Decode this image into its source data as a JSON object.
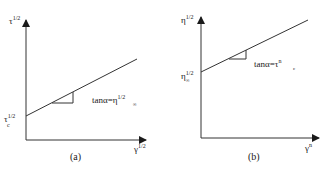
{
  "panels": [
    {
      "id": "a",
      "caption": "(a)",
      "y_axis_label": {
        "base": "τ",
        "sup": "1/2"
      },
      "x_axis_label": {
        "base": "γ",
        "sup": "1/2"
      },
      "intercept_label": {
        "base": "τ",
        "sub": "c",
        "sup": "1/2"
      },
      "slope_label": {
        "prefix": "tanα=",
        "base": "η",
        "sub": "∞",
        "sup": "1/2"
      }
    },
    {
      "id": "b",
      "caption": "(b)",
      "y_axis_label": {
        "base": "η",
        "sup": "1/2"
      },
      "x_axis_label": {
        "base": "γ",
        "sup": "n"
      },
      "intercept_label": {
        "base": "η",
        "sub": "∞",
        "sup": "1/2"
      },
      "slope_label": {
        "prefix": "tanα=",
        "base": "τ",
        "sub": "c",
        "sup": "n"
      }
    }
  ],
  "colors": {
    "line": "#333333",
    "background": "#ffffff"
  }
}
